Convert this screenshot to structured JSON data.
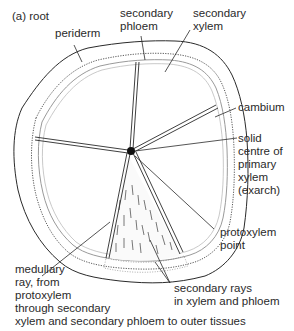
{
  "figure": {
    "title": "(a)  root",
    "labels": {
      "periderm": "periderm",
      "secondary_phloem": [
        "secondary",
        "phloem"
      ],
      "secondary_xylem": [
        "secondary",
        "xylem"
      ],
      "cambium": "cambium",
      "solid_centre": [
        "solid",
        "centre of",
        "primary",
        "xylem",
        "(exarch)"
      ],
      "protoxylem_point": [
        "protoxylem",
        "point"
      ],
      "secondary_rays": [
        "secondary rays",
        "in xylem and phloem"
      ],
      "medullary_ray": [
        "medullary",
        "ray, from",
        "protoxylem",
        "through secondary",
        "xylem and secondary phloem to outer tissues"
      ]
    },
    "colors": {
      "line": "#2a2a2a",
      "faint_line": "#9a9a9a",
      "background": "#ffffff"
    }
  }
}
